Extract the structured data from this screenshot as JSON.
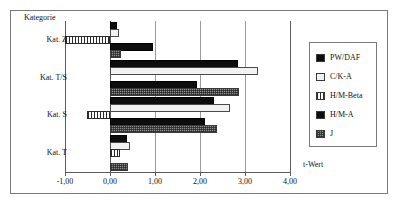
{
  "title": "",
  "axis_title_y": "Kategorie",
  "axis_title_x": "t-Wert",
  "legend": {
    "items": [
      {
        "label": "PW/DAF",
        "swatch": "solid-black-swatch",
        "color": "#0d0d0d"
      },
      {
        "label": "C/K-A",
        "swatch": "solid-white-swatch",
        "color": "#f2f2f2"
      },
      {
        "label": "H/M-Beta",
        "swatch": "vertical-hatch-swatch",
        "color": "#2b2b2b"
      },
      {
        "label": "H/M-A",
        "swatch": "solid-black-swatch",
        "color": "#0d0d0d"
      },
      {
        "label": "J",
        "swatch": "gray-texture-swatch",
        "color": "#8d8d8d"
      }
    ]
  },
  "chart_data": {
    "type": "bar",
    "orientation": "horizontal",
    "title": "",
    "xlabel": "t-Wert",
    "ylabel": "Kategorie",
    "xlim": [
      -1.0,
      4.0
    ],
    "xticks": [
      -1.0,
      0.0,
      1.0,
      2.0,
      3.0,
      4.0
    ],
    "xticklabels": [
      "-1,00",
      "0,00",
      "1,00",
      "2,00",
      "3,00",
      "4,00"
    ],
    "grid": true,
    "legend_position": "right",
    "categories": [
      "Kat. Z",
      "Kat. T/S",
      "Kat. S",
      "Kat. T"
    ],
    "series": [
      {
        "name": "PW/DAF",
        "values": [
          0.15,
          2.85,
          2.32,
          0.38
        ]
      },
      {
        "name": "C/K-A",
        "values": [
          0.2,
          3.28,
          2.67,
          0.45
        ]
      },
      {
        "name": "H/M-Beta",
        "values": [
          -1.0,
          0.0,
          -0.52,
          0.22
        ]
      },
      {
        "name": "H/M-A",
        "values": [
          0.95,
          1.93,
          2.1,
          0.0
        ]
      },
      {
        "name": "J",
        "values": [
          0.25,
          2.87,
          2.38,
          0.4
        ]
      }
    ]
  }
}
